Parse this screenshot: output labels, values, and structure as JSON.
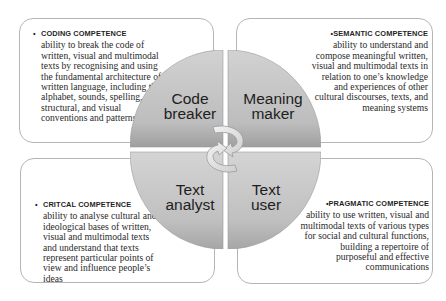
{
  "diagram": {
    "type": "four-resources model",
    "center": {
      "icon": "cycle-arrows-icon",
      "quadrants": [
        {
          "id": "tl",
          "label_lines": [
            "Code",
            "breaker"
          ]
        },
        {
          "id": "tr",
          "label_lines": [
            "Meaning",
            "maker"
          ]
        },
        {
          "id": "bl",
          "label_lines": [
            "Text",
            "analyst"
          ]
        },
        {
          "id": "br",
          "label_lines": [
            "Text",
            "user"
          ]
        }
      ]
    },
    "boxes": [
      {
        "id": "tl",
        "bullet": "•",
        "title": "CODING COMPETENCE",
        "lines": [
          "ability to break the code of",
          "written, visual and multimodal",
          "texts by recognising and using",
          "the fundamental architecture of",
          "written language, including the",
          "alphabet, sounds, spelling,",
          "structural, and visual",
          "conventions and patterns"
        ]
      },
      {
        "id": "tr",
        "bullet": "•",
        "title": "SEMANTIC COMPETENCE",
        "lines": [
          "ability to understand and",
          "compose meaningful written,",
          "visual and multimodal texts in",
          "relation to one’s knowledge",
          "and experiences of other",
          "cultural discourses, texts, and",
          "meaning systems"
        ]
      },
      {
        "id": "bl",
        "bullet": "•",
        "title": "CRITCAL COMPETENCE",
        "lines": [
          "ability to analyse cultural and",
          "ideological bases of written,",
          "visual and multimodal texts",
          "and understand that texts",
          "represent particular points of",
          "view and influence people’s",
          "ideas"
        ]
      },
      {
        "id": "br",
        "bullet": "•",
        "title": "PRAGMATIC COMPETENCE",
        "lines": [
          "ability to use written, visual and",
          "multimodal texts of various types",
          "for social and cultural functions,",
          "building a repertoire of",
          "purposeful and effective",
          "communications"
        ]
      }
    ],
    "colors": {
      "quadrant_light": "#cfcfcf",
      "quadrant_dark": "#a3a3a3",
      "box_border": "#b5b5b5",
      "text": "#2a2a2a",
      "arrow": "#e6e6e6"
    }
  }
}
